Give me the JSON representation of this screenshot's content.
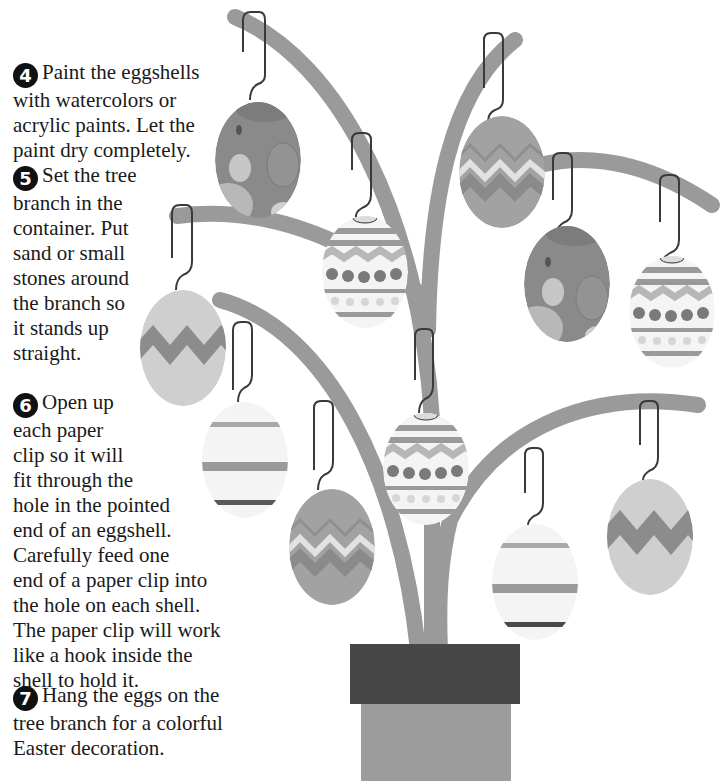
{
  "instructions": {
    "steps": [
      {
        "number": "4",
        "icon": "circled-number-4",
        "lines": [
          "Paint the eggshells",
          "with watercolors or",
          "acrylic paints.  Let the",
          "paint dry completely."
        ]
      },
      {
        "number": "5",
        "icon": "circled-number-5",
        "lines": [
          "Set the tree",
          "branch in the",
          "container.  Put",
          "sand or small",
          "stones around",
          "the branch so",
          "it stands up",
          "straight."
        ]
      },
      {
        "number": "6",
        "icon": "circled-number-6",
        "lines": [
          "Open up",
          "each paper",
          "clip so it will",
          "fit through the",
          "hole in the pointed",
          "end of an eggshell.",
          "Carefully feed one",
          "end of a paper clip into",
          "the hole on each shell.",
          "The paper clip will work",
          "like a hook inside the",
          "shell to hold it."
        ]
      },
      {
        "number": "7",
        "icon": "circled-number-7",
        "lines": [
          "Hang the eggs on the",
          "tree branch for a colorful",
          "Easter decoration."
        ]
      }
    ]
  },
  "illustration": {
    "subject": "easter-egg-tree-in-pot",
    "colors": {
      "branch": "#9a9a9a",
      "pot": "#9c9c9c",
      "pot_rim": "#474747",
      "hook": "#3a3a3a",
      "egg_dark": "#8a8a8a",
      "egg_mid": "#a9a9a9",
      "egg_light": "#d2d2d2",
      "egg_white": "#f4f4f4"
    },
    "eggs": [
      {
        "pattern": "polka-dot",
        "position": "top-left"
      },
      {
        "pattern": "zigzag-dots",
        "position": "upper-center"
      },
      {
        "pattern": "zigzag-stripes",
        "position": "top-right"
      },
      {
        "pattern": "polka-dot",
        "position": "right"
      },
      {
        "pattern": "zigzag-dots",
        "position": "far-right"
      },
      {
        "pattern": "zigzag",
        "position": "left"
      },
      {
        "pattern": "stripes",
        "position": "lower-left"
      },
      {
        "pattern": "zigzag-dots",
        "position": "center"
      },
      {
        "pattern": "zigzag-stripes",
        "position": "lower-center"
      },
      {
        "pattern": "stripes",
        "position": "lower-right"
      },
      {
        "pattern": "zigzag",
        "position": "far-lower-right"
      }
    ]
  }
}
